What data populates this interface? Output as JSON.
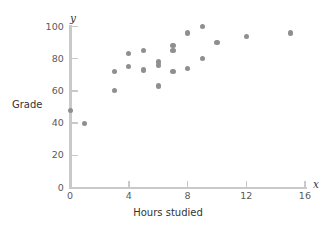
{
  "chart_data": {
    "type": "scatter",
    "title": "",
    "xlabel": "Hours studied",
    "ylabel": "Grade",
    "x_var": "x",
    "y_var": "y",
    "xlim": [
      0,
      16
    ],
    "ylim": [
      0,
      100
    ],
    "xticks": [
      0,
      4,
      8,
      12,
      16
    ],
    "yticks": [
      0,
      20,
      40,
      60,
      80,
      100
    ],
    "xtick_labels": [
      "0",
      "4",
      "8",
      "12",
      "16"
    ],
    "ytick_labels": [
      "0",
      "20",
      "40",
      "60",
      "80",
      "100"
    ],
    "grid": false,
    "legend": "none",
    "marker_color": "#8f8f8f",
    "axis_color": "#c9c9c9",
    "points": [
      {
        "x": 0,
        "y": 48
      },
      {
        "x": 1,
        "y": 40
      },
      {
        "x": 3,
        "y": 72
      },
      {
        "x": 3,
        "y": 60
      },
      {
        "x": 4,
        "y": 83
      },
      {
        "x": 4,
        "y": 75
      },
      {
        "x": 5,
        "y": 85
      },
      {
        "x": 5,
        "y": 73
      },
      {
        "x": 6,
        "y": 78
      },
      {
        "x": 6,
        "y": 76
      },
      {
        "x": 6,
        "y": 63
      },
      {
        "x": 7,
        "y": 88
      },
      {
        "x": 7,
        "y": 85
      },
      {
        "x": 7,
        "y": 72
      },
      {
        "x": 8,
        "y": 96
      },
      {
        "x": 8,
        "y": 74
      },
      {
        "x": 9,
        "y": 100
      },
      {
        "x": 9,
        "y": 80
      },
      {
        "x": 10,
        "y": 90
      },
      {
        "x": 12,
        "y": 94
      },
      {
        "x": 15,
        "y": 96
      }
    ]
  }
}
